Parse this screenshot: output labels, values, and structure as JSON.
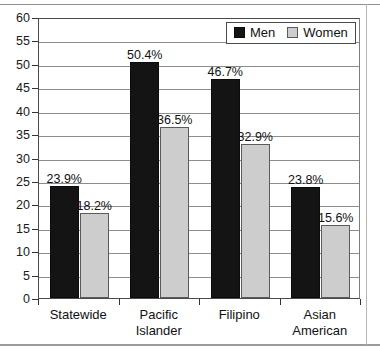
{
  "chart_data": {
    "type": "bar",
    "title": "",
    "subtitle": "",
    "xlabel": "",
    "ylabel": "",
    "categories": [
      "Statewide",
      "Pacific Islander",
      "Filipino",
      "Asian American"
    ],
    "series": [
      {
        "name": "Men",
        "color": "#141414",
        "values": [
          23.9,
          50.4,
          46.7,
          23.8
        ],
        "labels": [
          "23.9%",
          "50.4%",
          "46.7%",
          "23.8%"
        ]
      },
      {
        "name": "Women",
        "color": "#cdcdcd",
        "values": [
          18.2,
          36.5,
          32.9,
          15.6
        ],
        "labels": [
          "18.2%",
          "36.5%",
          "32.9%",
          "15.6%"
        ]
      }
    ],
    "ylim": [
      0,
      60
    ],
    "ytick_step": 5,
    "yticks": [
      0,
      5,
      10,
      15,
      20,
      25,
      30,
      35,
      40,
      45,
      50,
      55,
      60
    ],
    "ytick_labels": [
      "0",
      "5",
      "10",
      "15",
      "20",
      "25",
      "30",
      "35",
      "40",
      "45",
      "50",
      "55",
      "60"
    ],
    "grid": true,
    "legend_position": "top-right"
  },
  "legend": {
    "entries": [
      {
        "label": "Men"
      },
      {
        "label": "Women"
      }
    ]
  },
  "category_lines": [
    [
      "Statewide"
    ],
    [
      "Pacific",
      "Islander"
    ],
    [
      "Filipino"
    ],
    [
      "Asian",
      "American"
    ]
  ]
}
